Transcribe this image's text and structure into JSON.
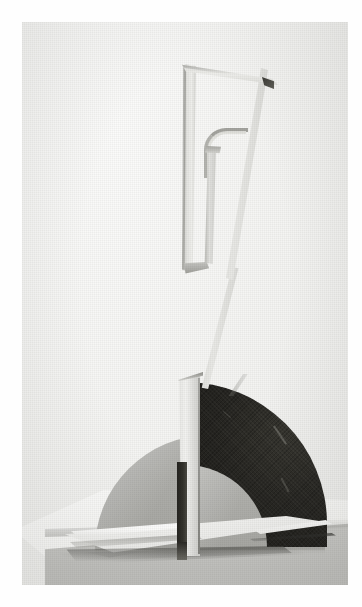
{
  "page": {
    "kind": "scanned-photograph",
    "orientation": "portrait",
    "paper_margin_color": "#ffffff",
    "photo_background_color": "#f4f4f2",
    "caption": ""
  },
  "photograph": {
    "subject": "abstract constructivist sculpture",
    "medium": "black and white halftone photograph",
    "tone_range": "light grey background, mid-grey discs, near-black quarter disc"
  },
  "palette": {
    "paper_white": "#ffffff",
    "photo_ground": "#f4f4f2",
    "pedestal_top": "#f8f8f6",
    "pedestal_front": "#c4c4c1",
    "disc_light_grey": "#aeaeaa",
    "disc_dark_black": "#211f1c",
    "metal_light": "#e8e8e5",
    "metal_shadow": "#8f8f8a"
  },
  "elements": {
    "pedestal": {
      "name": "display plinth",
      "surface": "top face catching light, grey front face"
    },
    "base_plate": {
      "name": "sculpture base plate",
      "note": "flat rectangular foot with bright specular edge"
    },
    "disc_light": {
      "name": "light grey semicircular disc",
      "shape": "semicircle"
    },
    "disc_dark": {
      "name": "dark quarter-circle disc",
      "shape": "quarter circle with quarter-arc notch at lower left"
    },
    "vertical_plate": {
      "name": "central vertical plate",
      "note": "narrow upright slab with dark band on left face"
    },
    "strut": {
      "name": "diagonal connecting strut"
    },
    "frame": {
      "name": "upper trapezoidal frame",
      "members": [
        "top bar",
        "left vertical member",
        "right diagonal member"
      ],
      "detail": "dark notch at upper right corner"
    },
    "hook": {
      "name": "inner j-hook element",
      "note": "curved rod descending inside the frame"
    }
  }
}
